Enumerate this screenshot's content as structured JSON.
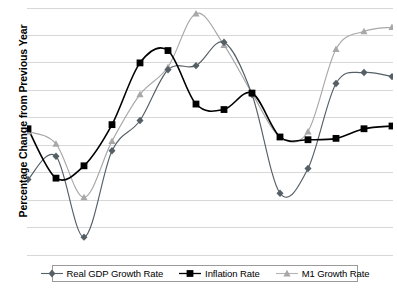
{
  "chart_data": {
    "type": "line",
    "title": "",
    "xlabel": "",
    "ylabel": "Percentage Change from Previous Year",
    "grid": true,
    "gridlines": 10,
    "legend_position": "bottom",
    "x": [
      1,
      2,
      3,
      4,
      5,
      6,
      7,
      8,
      9,
      10,
      11,
      12,
      13,
      14
    ],
    "xlim": [
      1,
      14
    ],
    "ylim": [
      -4,
      14
    ],
    "series": [
      {
        "name": "Real GDP Growth Rate",
        "marker": "diamond",
        "color": "#555f66",
        "values": [
          1.5,
          3.2,
          -2.7,
          3.6,
          5.8,
          9.5,
          9.8,
          11.5,
          7.7,
          0.5,
          2.3,
          8.5,
          9.3,
          9.0
        ]
      },
      {
        "name": "Inflation Rate",
        "marker": "square",
        "color": "#000000",
        "values": [
          5.2,
          1.6,
          2.5,
          5.5,
          10.0,
          10.9,
          7.0,
          6.6,
          7.8,
          4.6,
          4.4,
          4.5,
          5.2,
          5.4
        ]
      },
      {
        "name": "M1 Growth Rate",
        "marker": "triangle",
        "color": "#a8a8a8",
        "values": [
          5.0,
          4.1,
          0.2,
          4.3,
          7.7,
          9.7,
          13.6,
          11.3,
          7.8,
          4.6,
          5.0,
          11.0,
          12.3,
          12.6
        ]
      }
    ]
  },
  "legend": {
    "items": [
      {
        "label": "Real GDP Growth Rate",
        "marker": "diamond",
        "color": "#555f66"
      },
      {
        "label": "Inflation Rate",
        "marker": "square",
        "color": "#000000"
      },
      {
        "label": "M1 Growth Rate",
        "marker": "triangle",
        "color": "#a8a8a8"
      }
    ]
  },
  "axis": {
    "y_title": "Percentage Change from Previous Year"
  },
  "caption": {
    "text": ""
  },
  "colors": {
    "grid": "#d8d8d8",
    "background": "#ffffff",
    "legend_border": "#9a9a9a"
  }
}
